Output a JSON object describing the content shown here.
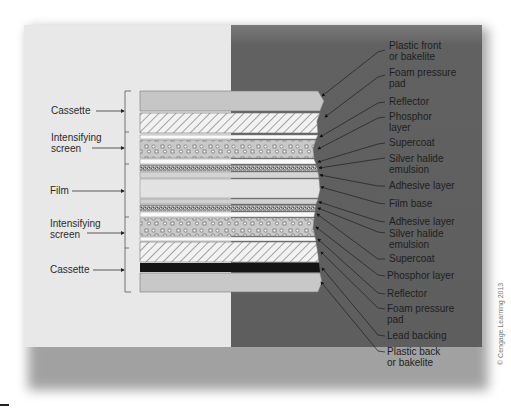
{
  "figure": {
    "copyright": "© Cengage Learning 2013",
    "colors": {
      "left_background": "#e8e8e8",
      "right_background": "#5e5e5e",
      "cassette_plastic": "#c8c8c8",
      "lead_backing": "#111111",
      "text": "#222222"
    }
  },
  "left_labels": [
    {
      "id": "cassette-top",
      "text": "Cassette"
    },
    {
      "id": "intensifying-screen-top",
      "text": "Intensifying\nscreen"
    },
    {
      "id": "film",
      "text": "Film"
    },
    {
      "id": "intensifying-screen-bottom",
      "text": "Intensifying\nscreen"
    },
    {
      "id": "cassette-bottom",
      "text": "Cassette"
    }
  ],
  "right_labels": [
    {
      "text": "Plastic front\nor bakelite"
    },
    {
      "text": "Foam pressure\npad"
    },
    {
      "text": "Reflector"
    },
    {
      "text": "Phosphor\nlayer"
    },
    {
      "text": "Supercoat"
    },
    {
      "text": "Silver halide\nemulsion"
    },
    {
      "text": "Adhesive layer"
    },
    {
      "text": "Film base"
    },
    {
      "text": "Adhesive layer"
    },
    {
      "text": "Silver halide\nemulsion"
    },
    {
      "text": "Supercoat"
    },
    {
      "text": "Phosphor layer"
    },
    {
      "text": "Reflector"
    },
    {
      "text": "Foam pressure\npad"
    },
    {
      "text": "Lead backing"
    },
    {
      "text": "Plastic back\nor bakelite"
    }
  ],
  "layers": [
    {
      "name": "plastic-front",
      "pattern": "solid-gray"
    },
    {
      "name": "foam-pressure-pad-top",
      "pattern": "hatch"
    },
    {
      "name": "reflector-top",
      "pattern": "white"
    },
    {
      "name": "phosphor-layer-top",
      "pattern": "dots"
    },
    {
      "name": "supercoat-top",
      "pattern": "white"
    },
    {
      "name": "silver-halide-emulsion-top",
      "pattern": "speckle"
    },
    {
      "name": "adhesive-layer-top",
      "pattern": "light"
    },
    {
      "name": "film-base",
      "pattern": "light"
    },
    {
      "name": "adhesive-layer-bottom",
      "pattern": "light"
    },
    {
      "name": "silver-halide-emulsion-bottom",
      "pattern": "speckle"
    },
    {
      "name": "supercoat-bottom",
      "pattern": "white"
    },
    {
      "name": "phosphor-layer-bottom",
      "pattern": "dots"
    },
    {
      "name": "reflector-bottom",
      "pattern": "white"
    },
    {
      "name": "foam-pressure-pad-bottom",
      "pattern": "hatch"
    },
    {
      "name": "lead-backing",
      "pattern": "black"
    },
    {
      "name": "plastic-back",
      "pattern": "solid-gray"
    }
  ]
}
